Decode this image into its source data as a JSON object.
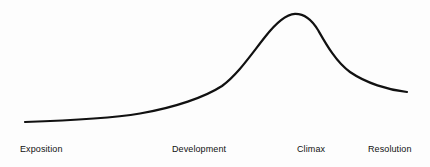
{
  "diagram": {
    "name": "narrative-arc",
    "background_color": "#fdfdfd",
    "stroke_color": "#111111",
    "stroke_width": 2.2,
    "width": 430,
    "height": 167
  },
  "labels": [
    {
      "text": "Exposition",
      "x": 20,
      "y": 144
    },
    {
      "text": "Development",
      "x": 172,
      "y": 144
    },
    {
      "text": "Climax",
      "x": 297,
      "y": 144
    },
    {
      "text": "Resolution",
      "x": 368,
      "y": 144
    }
  ],
  "chart_data": {
    "type": "line",
    "title": "",
    "xlabel": "",
    "ylabel": "",
    "grid": false,
    "legend": "none",
    "xlim": [
      0,
      430
    ],
    "ylim": [
      167,
      0
    ],
    "categories": [
      "Exposition",
      "Development",
      "Climax",
      "Resolution"
    ],
    "series": [
      {
        "name": "dramatic-tension",
        "points": [
          [
            25,
            122
          ],
          [
            60,
            120
          ],
          [
            95,
            118
          ],
          [
            125,
            115
          ],
          [
            150,
            111
          ],
          [
            175,
            105
          ],
          [
            200,
            96
          ],
          [
            220,
            87
          ],
          [
            232,
            76
          ],
          [
            245,
            61
          ],
          [
            258,
            46
          ],
          [
            270,
            33
          ],
          [
            282,
            21
          ],
          [
            295,
            14
          ],
          [
            305,
            15
          ],
          [
            313,
            21
          ],
          [
            320,
            32
          ],
          [
            328,
            46
          ],
          [
            338,
            60
          ],
          [
            350,
            71
          ],
          [
            363,
            80
          ],
          [
            378,
            86
          ],
          [
            392,
            90
          ],
          [
            407,
            92
          ]
        ],
        "path": "M 25 122 C 70 120.5 110 118.5 140 113.5 C 175 107.5 205 97 222 86 C 238 74 250 56 265 37 C 275 24 285 14.5 295 13.8 C 305 13.5 312 20 318 30 C 326 44 336 62 350 72 C 366 83 388 90 407 92"
      }
    ],
    "annotations": [
      {
        "label": "Exposition",
        "x": 25,
        "y": 122,
        "role": "start-low-tension"
      },
      {
        "label": "Development",
        "x": 205,
        "y": 95,
        "role": "rising-action"
      },
      {
        "label": "Climax",
        "x": 295,
        "y": 14,
        "role": "peak"
      },
      {
        "label": "Resolution",
        "x": 407,
        "y": 92,
        "role": "denouement"
      }
    ]
  }
}
